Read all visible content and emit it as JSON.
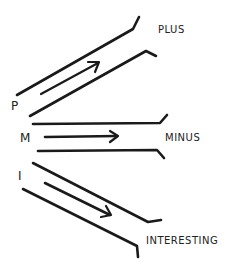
{
  "diagram": {
    "type": "hand-drawn PMI thinking diagram",
    "ink_color": "#1a1a1a",
    "background": "#ffffff",
    "branches": [
      {
        "key": "P",
        "letter": "P",
        "label": "PLUS",
        "direction": "up-right"
      },
      {
        "key": "M",
        "letter": "M",
        "label": "MINUS",
        "direction": "right"
      },
      {
        "key": "I",
        "letter": "I",
        "label": "INTERESTING",
        "direction": "down-right"
      }
    ]
  }
}
